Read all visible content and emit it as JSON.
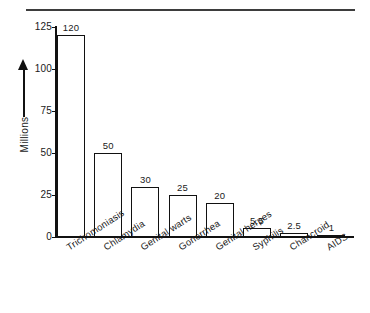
{
  "chart_data": {
    "type": "bar",
    "title": "",
    "subtitle": "",
    "xlabel": "",
    "ylabel": "Millions",
    "ylim": [
      0,
      125
    ],
    "yticks": [
      0,
      25,
      50,
      75,
      100,
      125
    ],
    "ytick_labels": [
      "0",
      "25",
      "50",
      "75",
      "100",
      "125"
    ],
    "grid": false,
    "legend": false,
    "orientation": "vertical",
    "bar_style": "outlined-white",
    "categories": [
      "Trichomoniasis",
      "Chlamydia",
      "Genital warts",
      "Gonorrhea",
      "Genital herpes",
      "Syphilis",
      "Chancroid",
      "AIDS"
    ],
    "values": [
      120,
      50,
      30,
      25,
      20,
      5.5,
      2.5,
      1
    ],
    "data_labels": [
      "120",
      "50",
      "30",
      "25",
      "20",
      "5.5",
      "2.5",
      "1"
    ],
    "colors": {
      "bar_fill": "#ffffff",
      "bar_edge": "#111111",
      "axis": "#111111",
      "text": "#1a1a1a",
      "background": "#ffffff",
      "top_rule": "#3d3d3d"
    }
  },
  "figure": {
    "axis_title": "Millions",
    "arrow_icon": "up-arrow-icon",
    "top_rule_name": "horizontal-rule"
  }
}
